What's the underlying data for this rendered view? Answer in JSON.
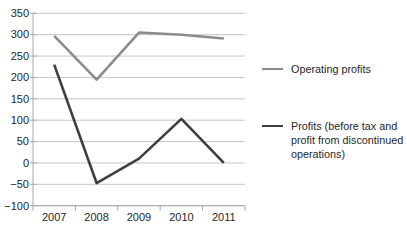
{
  "chart_data": {
    "type": "line",
    "title": "",
    "xlabel": "",
    "ylabel": "",
    "categories": [
      "2007",
      "2008",
      "2009",
      "2010",
      "2011"
    ],
    "series": [
      {
        "name": "Operating profits",
        "color": "#8c8c8c",
        "values": [
          297,
          195,
          305,
          300,
          291
        ]
      },
      {
        "name": "Profits (before tax and profit from discontinued operations)",
        "color": "#3f3f3f",
        "values": [
          230,
          -47,
          10,
          103,
          0
        ]
      }
    ],
    "ylim": [
      -100,
      350
    ],
    "y_tick_step": 50,
    "y_ticks": [
      350,
      300,
      250,
      200,
      150,
      100,
      50,
      0,
      -50,
      -100
    ],
    "y_tick_labels": [
      "350",
      "300",
      "250",
      "200",
      "150",
      "100",
      "50",
      "0",
      "−50",
      "−100"
    ],
    "grid": true,
    "legend_position": "right"
  },
  "legend": {
    "items": [
      {
        "label": "Operating profits",
        "color": "#8c8c8c"
      },
      {
        "label": "Profits (before tax and profit from discontinued operations)",
        "color": "#3f3f3f"
      }
    ]
  },
  "colors": {
    "gridline": "#c6c6c6",
    "axis": "#a8a8a8",
    "tick_text": "#262626",
    "legend_text": "#1f1f1f",
    "background": "#ffffff"
  }
}
